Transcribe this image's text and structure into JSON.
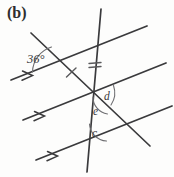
{
  "figure": {
    "panel_label": "(b)",
    "type": "geometry-diagram",
    "background_color": "#fdfdfc",
    "line_color": "#3a3a3c",
    "arc_color": "#6d6d70",
    "labels": {
      "angle_36": "36°",
      "angle_d": "d",
      "angle_e": "e",
      "angle_c": "c"
    },
    "markings": {
      "parallel_arrow_count": 1,
      "transversal_vertical_tick": "double",
      "transversal_diagonal_tick": "single"
    },
    "elements": [
      {
        "name": "parallel-line-top",
        "kind": "parallel-line",
        "arrow_marks": 1,
        "x1": 11,
        "y1": 80,
        "x2": 147,
        "y2": 26
      },
      {
        "name": "parallel-line-middle",
        "kind": "parallel-line",
        "arrow_marks": 1,
        "x1": 23,
        "y1": 120,
        "x2": 166,
        "y2": 63
      },
      {
        "name": "parallel-line-bottom",
        "kind": "parallel-line",
        "arrow_marks": 1,
        "x1": 36,
        "y1": 160,
        "x2": 172,
        "y2": 106
      },
      {
        "name": "transversal-vertical",
        "kind": "transversal",
        "tick_marks": 2,
        "x1": 101,
        "y1": 9,
        "x2": 87,
        "y2": 172
      },
      {
        "name": "transversal-diagonal",
        "kind": "transversal",
        "tick_marks": 1,
        "x1": 31,
        "y1": 33,
        "x2": 150,
        "y2": 146
      }
    ],
    "angles": [
      {
        "name": "angle-36",
        "label": "36°",
        "value": 36,
        "unit": "degrees",
        "vertex": "upper-left-intersection"
      },
      {
        "name": "angle-d",
        "label": "d",
        "value": null,
        "unit": "unknown",
        "vertex": "center-intersection"
      },
      {
        "name": "angle-e",
        "label": "e",
        "value": null,
        "unit": "unknown",
        "vertex": "center-intersection"
      },
      {
        "name": "angle-c",
        "label": "c",
        "value": null,
        "unit": "unknown",
        "vertex": "lower-intersection"
      }
    ]
  }
}
